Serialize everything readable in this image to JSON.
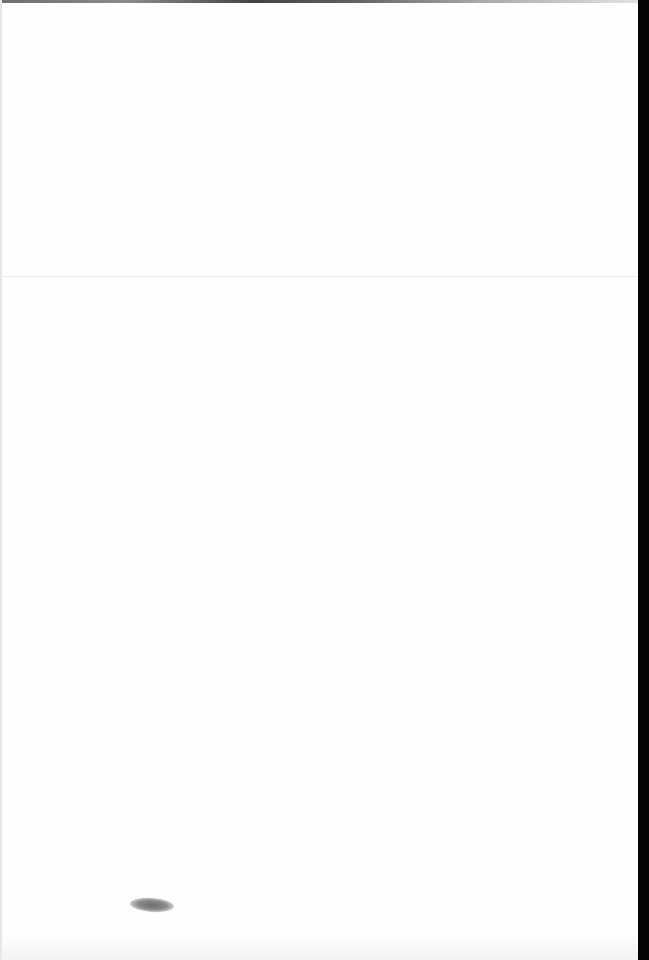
{
  "document": {
    "type": "scanned-page",
    "text": "",
    "colors": {
      "paper": "#fefefe",
      "scan_border": "#050505",
      "smudge": "#6e6e6e"
    }
  }
}
